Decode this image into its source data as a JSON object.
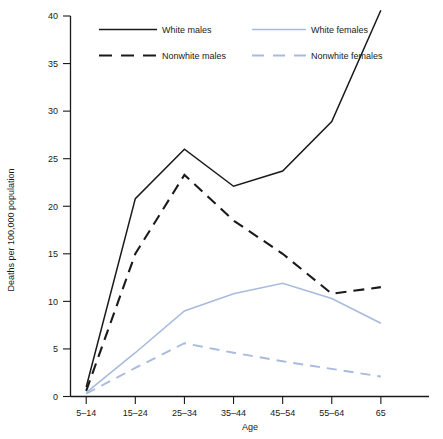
{
  "chart_data": {
    "type": "line",
    "title": "",
    "xlabel": "Age",
    "ylabel": "Deaths per 100,000 population",
    "categories": [
      "5–14",
      "15–24",
      "25–34",
      "35–44",
      "45–54",
      "55–64",
      "65"
    ],
    "ylim": [
      0,
      40
    ],
    "yticks": [
      0,
      5,
      10,
      15,
      20,
      25,
      30,
      35,
      40
    ],
    "ytick_labels": [
      "0",
      "5",
      "10",
      "15",
      "20",
      "25",
      "30",
      "35",
      "40"
    ],
    "grid": false,
    "legend_position": "top",
    "series": [
      {
        "name": "White males",
        "values": [
          1.0,
          20.8,
          26.0,
          22.1,
          23.7,
          28.9,
          40.6
        ],
        "color": "#1a1a1a",
        "style": "solid"
      },
      {
        "name": "Nonwhite males",
        "values": [
          0.6,
          15.0,
          23.3,
          18.5,
          15.0,
          10.8,
          11.5
        ],
        "color": "#1a1a1a",
        "style": "dashed"
      },
      {
        "name": "White females",
        "values": [
          0.4,
          4.6,
          9.0,
          10.8,
          11.9,
          10.3,
          7.7
        ],
        "color": "#a8bbdd",
        "style": "solid"
      },
      {
        "name": "Nonwhite females",
        "values": [
          0.3,
          3.0,
          5.6,
          4.6,
          3.7,
          2.9,
          2.1
        ],
        "color": "#a8bbdd",
        "style": "dashed"
      }
    ]
  },
  "legend": {
    "entries": [
      {
        "label": "White males"
      },
      {
        "label": "White females"
      },
      {
        "label": "Nonwhite males"
      },
      {
        "label": "Nonwhite females"
      }
    ]
  },
  "axes": {
    "x_title": "Age",
    "y_title": "Deaths per 100,000 population"
  }
}
